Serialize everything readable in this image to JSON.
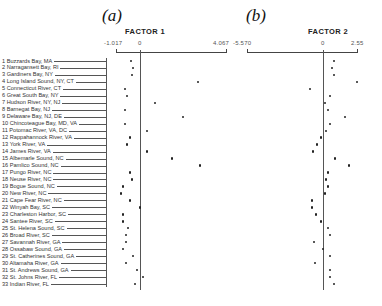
{
  "chart_data": [
    {
      "type": "scatter",
      "panel": "(a)",
      "title": "FACTOR 1",
      "xlabel": "FACTOR 1",
      "ylabel": "",
      "xlim": [
        -1.017,
        4.067
      ],
      "tick_labels": [
        "-1.017",
        "0",
        "4.067"
      ],
      "grid": false,
      "categories": [
        "1 Buzzards Bay, MA",
        "2 Narragansett Bay, RI",
        "3 Gardiners Bay, NY",
        "4 Long Island Sound, NY, CT",
        "5 Connecticut River, CT",
        "6 Great South Bay, NY",
        "7 Hudson River, NY, NJ",
        "8 Barnegat Bay, NJ",
        "9 Delaware Bay, NJ, DE",
        "10 Chincoteague Bay, MD, VA",
        "11 Potomac River, VA, DC",
        "12 Rappahannock River, VA",
        "13 York River, VA",
        "14 James River, VA",
        "15 Albemarle Sound, NC",
        "16 Pamlico Sound, NC",
        "17 Pungo River, NC",
        "18 Neuse River, NC",
        "19 Bogue Sound, NC",
        "20 New River, NC",
        "21 Cape Fear River, NC",
        "22 Winyah Bay, SC",
        "23 Charleston Harbor, SC",
        "24 Santee River, SC",
        "25 St. Helena Sound, SC",
        "26 Broad River, SC",
        "27 Savannah River, GA",
        "28 Ossabaw Sound, GA",
        "29 St. Catherines Sound, GA",
        "30 Altamaha River, GA",
        "31 St. Andrews Sound, GA",
        "32 St. Johns River, FL",
        "33 Indian River, FL"
      ],
      "values": [
        -0.43,
        -0.33,
        -0.38,
        2.74,
        -0.71,
        -0.61,
        0.71,
        -0.71,
        2.03,
        -0.71,
        0.33,
        -0.47,
        -0.61,
        0.33,
        1.51,
        2.84,
        -0.47,
        -0.38,
        -0.8,
        -0.9,
        -0.47,
        0.0,
        -0.8,
        -0.8,
        -0.57,
        -0.66,
        -0.66,
        -0.8,
        -0.33,
        -0.66,
        -0.14,
        0.14,
        -0.24
      ]
    },
    {
      "type": "scatter",
      "panel": "(b)",
      "title": "FACTOR 2",
      "xlabel": "FACTOR 2",
      "ylabel": "",
      "xlim": [
        -5.57,
        2.55
      ],
      "tick_labels": [
        "-5.570",
        "0",
        "2.55"
      ],
      "grid": false,
      "categories": "same as panel (a)",
      "values": [
        0.83,
        0.68,
        0.83,
        2.55,
        -0.98,
        0.53,
        0.15,
        0.38,
        1.65,
        0.53,
        0.23,
        -0.15,
        -0.45,
        -0.75,
        0.9,
        1.95,
        0.38,
        0.23,
        0.38,
        0.15,
        -0.83,
        -0.83,
        -0.53,
        -0.15,
        0.38,
        0.53,
        -0.68,
        0.0,
        0.53,
        -0.6,
        0.53,
        0.53,
        0.83
      ]
    }
  ],
  "panels": {
    "a": {
      "label": "(a)",
      "title": "FACTOR 1",
      "min": "-1.017",
      "zero": "0",
      "max": "4.067"
    },
    "b": {
      "label": "(b)",
      "title": "FACTOR 2",
      "min": "-5.570",
      "zero": "0",
      "max": "2.55"
    }
  },
  "sites": [
    "1 Buzzards Bay, MA",
    "2 Narragansett Bay, RI",
    "3 Gardiners Bay, NY",
    "4 Long Island Sound, NY, CT",
    "5 Connecticut River, CT",
    "6 Great South Bay, NY",
    "7 Hudson River, NY, NJ",
    "8 Barnegat Bay, NJ",
    "9 Delaware Bay, NJ, DE",
    "10 Chincoteague Bay, MD, VA",
    "11 Potomac River, VA, DC",
    "12 Rappahannock River, VA",
    "13 York River, VA",
    "14 James River, VA",
    "15 Albemarle Sound, NC",
    "16 Pamlico Sound, NC",
    "17 Pungo River, NC",
    "18 Neuse River, NC",
    "19 Bogue Sound, NC",
    "20 New River, NC",
    "21 Cape Fear River, NC",
    "22 Winyah Bay, SC",
    "23 Charleston Harbor, SC",
    "24 Santee River, SC",
    "25 St. Helena Sound, SC",
    "26 Broad River, SC",
    "27 Savannah River, GA",
    "28 Ossabaw Sound, GA",
    "29 St. Catherines Sound, GA",
    "30 Altamaha River, GA",
    "31 St. Andrews Sound, GA",
    "32 St. Johns River, FL",
    "33 Indian River, FL"
  ]
}
